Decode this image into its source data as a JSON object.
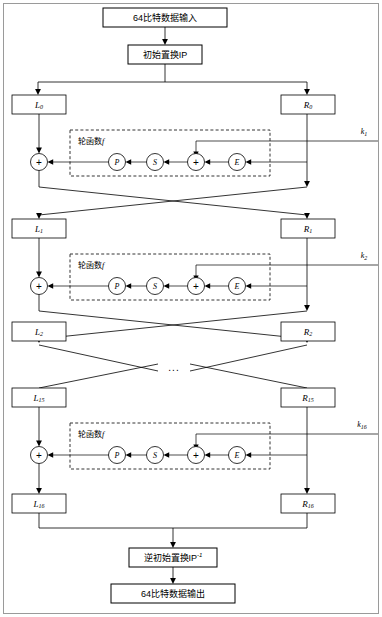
{
  "diagram": {
    "type": "flowchart",
    "colors": {
      "stroke": "#000000",
      "background": "#ffffff",
      "border": "#9a9a9a"
    },
    "io": {
      "input_label": "64比特数据输入",
      "initial_permutation_label": "初始置换IP",
      "inverse_permutation_label": "逆初始置换IP",
      "inverse_permutation_sup": "-1",
      "output_label": "64比特数据输出"
    },
    "round_function": {
      "label_cn": "轮函数",
      "label_var": "f",
      "nodes": [
        "P",
        "S",
        "E"
      ],
      "xor_symbol": "+"
    },
    "ellipsis": "...",
    "rounds": [
      {
        "left_label": "L",
        "left_sub": "0",
        "right_label": "R",
        "right_sub": "0",
        "key_label": "k",
        "key_sub": "1",
        "has_round_function": true,
        "has_crossover": true
      },
      {
        "left_label": "L",
        "left_sub": "1",
        "right_label": "R",
        "right_sub": "1",
        "key_label": "k",
        "key_sub": "2",
        "has_round_function": true,
        "has_crossover": true
      },
      {
        "left_label": "L",
        "left_sub": "2",
        "right_label": "R",
        "right_sub": "2",
        "key_label": "",
        "key_sub": "",
        "has_round_function": false,
        "has_crossover": true
      },
      {
        "left_label": "L",
        "left_sub": "15",
        "right_label": "R",
        "right_sub": "15",
        "key_label": "k",
        "key_sub": "16",
        "has_round_function": true,
        "has_crossover": false
      },
      {
        "left_label": "L",
        "left_sub": "16",
        "right_label": "R",
        "right_sub": "16",
        "key_label": "",
        "key_sub": "",
        "has_round_function": false,
        "has_crossover": false
      }
    ]
  }
}
